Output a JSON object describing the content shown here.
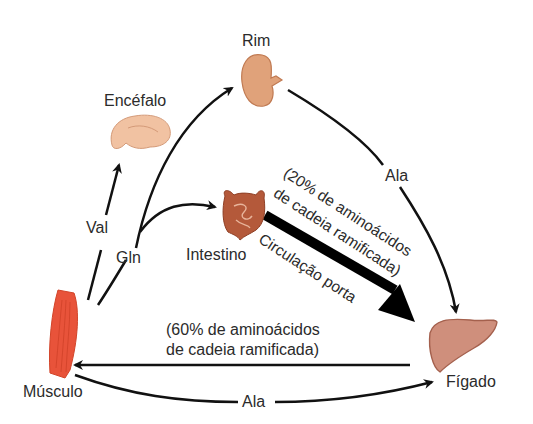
{
  "organs": {
    "rim": {
      "label": "Rim"
    },
    "encefalo": {
      "label": "Encéfalo"
    },
    "intestino": {
      "label": "Intestino"
    },
    "figado": {
      "label": "Fígado"
    },
    "musculo": {
      "label": "Músculo"
    }
  },
  "arrows": {
    "val": {
      "label": "Val"
    },
    "gln": {
      "label": "Gln"
    },
    "ala_rim_figado": {
      "label": "Ala"
    },
    "ala_musculo_figado": {
      "label": "Ala"
    },
    "portal": {
      "line1": "(20% de aminoácidos",
      "line2": "de cadeia ramificada)",
      "line3": "Circulação porta"
    },
    "figado_musculo": {
      "line1": "(60% de aminoácidos",
      "line2": "de cadeia ramificada)"
    }
  },
  "colors": {
    "muscle": "#e8533a",
    "kidney": "#e0a27a",
    "brain": "#f1c2a2",
    "intestine": "#b4593a",
    "liver": "#cf8f7c",
    "arrow": "#111111"
  }
}
